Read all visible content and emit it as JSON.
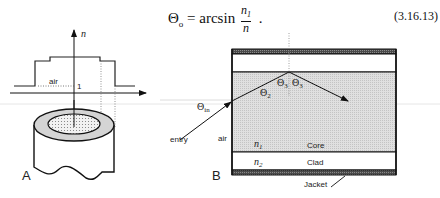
{
  "equation": {
    "lhs": "Θ",
    "lhs_subscript": "o",
    "equals": "=",
    "function": "arcsin",
    "numerator": "n",
    "numerator_subscript": "1",
    "denominator": "n",
    "trailing": ".",
    "number": "(3.16.13)"
  },
  "panel_a": {
    "label": "A",
    "axis_label": "n",
    "air_label": "air",
    "tick_label": "1"
  },
  "panel_b": {
    "label": "B",
    "angle_in": "Θ",
    "angle_in_subscript": "in",
    "angle_2": "Θ",
    "angle_2_subscript": "2",
    "angle_3_left": "Θ",
    "angle_3_left_subscript": "3",
    "angle_3_right": "Θ",
    "angle_3_right_subscript": "3",
    "entry_label": "entry",
    "air_label": "air",
    "core_index": "n",
    "core_index_subscript": "1",
    "clad_index": "n",
    "clad_index_subscript": "2",
    "core_label": "Core",
    "clad_label": "Clad",
    "jacket_label": "Jacket"
  },
  "colors": {
    "ink": "#1a1a1a",
    "core_fill": "#d9d9d9",
    "jacket_fill": "#555555",
    "cladding_ring": "#cfcfcf",
    "dotted_core": "#e8e8e8"
  }
}
